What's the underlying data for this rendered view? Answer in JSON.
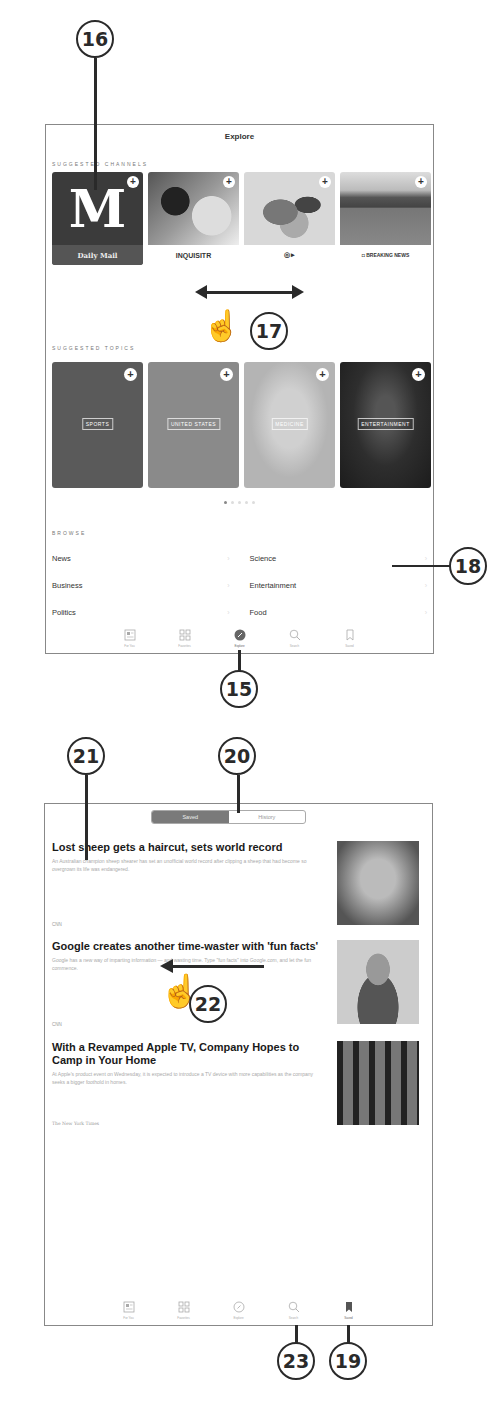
{
  "callouts": {
    "c15": "15",
    "c16": "16",
    "c17": "17",
    "c18": "18",
    "c19": "19",
    "c20": "20",
    "c21": "21",
    "c22": "22",
    "c23": "23"
  },
  "explore_screen": {
    "title": "Explore",
    "suggested_channels_label": "SUGGESTED CHANNELS",
    "channels": [
      {
        "name": "Daily Mail",
        "brand_text": "Daily Mail",
        "logo_glyph": "M",
        "bg": "#3b3b3b"
      },
      {
        "name": "Inquisitr",
        "brand_text": "INQUISITR",
        "image": "football-players"
      },
      {
        "name": "Channel 3",
        "brand_text": "◎ ▸",
        "image": "map-africa"
      },
      {
        "name": "Breaking News",
        "brand_text": "◘ BREAKING NEWS",
        "image": "tennis-stadium"
      }
    ],
    "suggested_topics_label": "SUGGESTED TOPICS",
    "topics": [
      {
        "label": "SPORTS",
        "bg": "#5a5a5a"
      },
      {
        "label": "UNITED STATES",
        "bg": "#8a8a8a"
      },
      {
        "label": "MEDICINE",
        "bg": "#b4b4b4"
      },
      {
        "label": "ENTERTAINMENT",
        "bg": "#2e2e2e"
      }
    ],
    "page_dots": {
      "count": 5,
      "active_index": 0
    },
    "browse_label": "BROWSE",
    "browse_left": [
      "News",
      "Business",
      "Politics"
    ],
    "browse_right": [
      "Science",
      "Entertainment",
      "Food"
    ],
    "chevron": "›"
  },
  "tabbar": {
    "tabs": [
      {
        "label": "For You",
        "icon": "for-you-icon"
      },
      {
        "label": "Favorites",
        "icon": "favorites-icon"
      },
      {
        "label": "Explore",
        "icon": "compass-icon"
      },
      {
        "label": "Search",
        "icon": "search-icon"
      },
      {
        "label": "Saved",
        "icon": "bookmark-icon"
      }
    ],
    "explore_screen_active": "Explore",
    "saved_screen_active": "Saved"
  },
  "saved_screen": {
    "segments": [
      "Saved",
      "History"
    ],
    "active_segment": "Saved",
    "articles": [
      {
        "title": "Lost sheep gets a haircut, sets world record",
        "summary": "An Australian champion sheep shearer has set an unofficial world record after clipping a sheep that had become so overgrown its life was endangered.",
        "source": "CNN"
      },
      {
        "title": "Google creates another time-waster with 'fun facts'",
        "summary": "Google has a new way of imparting information — and wasting time. Type \"fun facts\" into Google.com, and let the fun commence.",
        "source": "CNN"
      },
      {
        "title": "With a Revamped Apple TV, Company Hopes to Camp in Your Home",
        "summary": "At Apple's product event on Wednesday, it is expected to introduce a TV device with more capabilities as the company seeks a bigger foothold in homes.",
        "source": "The New York Times"
      }
    ]
  }
}
